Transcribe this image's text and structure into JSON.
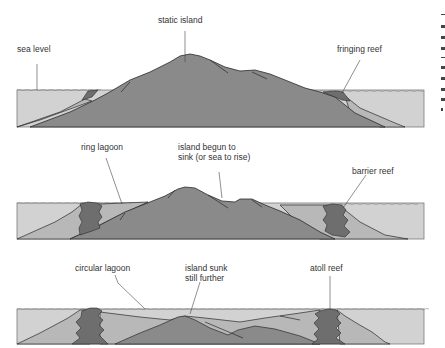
{
  "diagram": {
    "colors": {
      "background": "#ffffff",
      "sea": "#d2d2d2",
      "island": "#8a8a8a",
      "reef": "#6e6e6e",
      "sediment": "#b8b8b8",
      "outline": "#2a2a2a",
      "label": "#333333"
    },
    "panels": [
      {
        "stage": 1,
        "labels": [
          {
            "id": "sea-level",
            "text": "sea level"
          },
          {
            "id": "static-island",
            "text": "static island"
          },
          {
            "id": "fringing-reef",
            "text": "fringing reef"
          }
        ]
      },
      {
        "stage": 2,
        "labels": [
          {
            "id": "ring-lagoon",
            "text": "ring lagoon"
          },
          {
            "id": "island-sinking",
            "lines": [
              "island begun to",
              "sink (or sea to rise)"
            ]
          },
          {
            "id": "barrier-reef",
            "text": "barrier reef"
          }
        ]
      },
      {
        "stage": 3,
        "labels": [
          {
            "id": "circular-lagoon",
            "text": "circular lagoon"
          },
          {
            "id": "island-sunk",
            "lines": [
              "island sunk",
              "still further"
            ]
          },
          {
            "id": "atoll-reef",
            "text": "atoll reef"
          }
        ]
      }
    ]
  }
}
